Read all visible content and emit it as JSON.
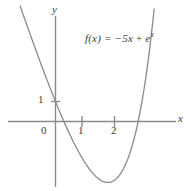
{
  "figure": {
    "background_color": "#ffffff",
    "axis_color": "#8a8a8a",
    "curve_color": "#8a8a8a",
    "text_color": "#3d3d3d",
    "equation": {
      "lhs": "f(x) = ",
      "term1": "−5x",
      "plus": " + ",
      "base": "e",
      "exponent": "x"
    },
    "axis_labels": {
      "x": "x",
      "y": "y"
    },
    "tick_labels": {
      "origin": "0",
      "x1": "1",
      "x2": "2",
      "y1": "1"
    }
  },
  "chart_data": {
    "type": "line",
    "title": "",
    "subtitle": "",
    "xlabel": "x",
    "ylabel": "y",
    "annotations": [
      "f(x) = −5x + e^x"
    ],
    "legend": [],
    "legend_position": "none",
    "grid": false,
    "xlim": [
      -1.45,
      3.75
    ],
    "ylim": [
      -4.3,
      5.2
    ],
    "xticks": [
      1,
      2
    ],
    "xtick_labels": [
      "1",
      "2"
    ],
    "yticks": [
      1
    ],
    "ytick_labels": [
      "1"
    ],
    "origin_label": "0",
    "axes_style": "arrowless-cross",
    "series": [
      {
        "name": "f(x) = -5x + e^x",
        "formula": "-5*x + Math.exp(x)",
        "color": "#8a8a8a",
        "x": [
          -1.45,
          -1.3,
          -1.15,
          -1.0,
          -0.85,
          -0.7,
          -0.55,
          -0.4,
          -0.25,
          -0.1,
          0.0,
          0.1,
          0.25,
          0.4,
          0.55,
          0.7,
          0.85,
          1.0,
          1.15,
          1.3,
          1.45,
          1.609,
          1.75,
          1.9,
          2.05,
          2.2,
          2.35,
          2.5,
          2.65,
          2.8,
          2.95,
          3.1,
          3.2,
          3.3,
          3.4
        ],
        "y": [
          7.48,
          6.77,
          6.07,
          5.37,
          4.68,
          3.99,
          3.33,
          2.67,
          2.03,
          1.405,
          1.0,
          0.605,
          -0.966,
          -0.508,
          -1.017,
          -1.486,
          -1.91,
          -2.282,
          -2.592,
          -2.831,
          -2.988,
          -3.047,
          -3.001,
          -2.815,
          -2.477,
          -1.974,
          -1.26,
          -0.318,
          0.886,
          2.396,
          4.261,
          7.264,
          8.493,
          10.62,
          13.0
        ]
      }
    ],
    "min_point": {
      "x": 1.609,
      "y": -3.047,
      "label": ""
    },
    "roots": [
      0.259,
      2.54
    ]
  }
}
